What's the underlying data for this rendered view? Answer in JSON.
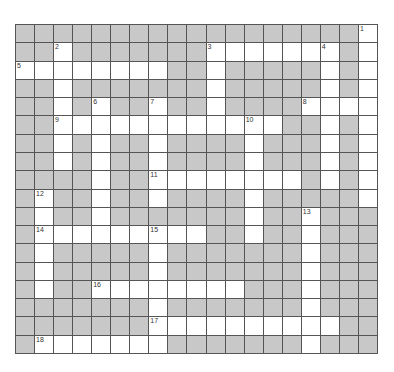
{
  "puzzle": {
    "rows": 18,
    "cols": 19,
    "colors": {
      "block": "#c8c8c8",
      "open": "#ffffff",
      "line": "#555555"
    },
    "open_cells": [
      [
        18
      ],
      [
        2,
        10,
        11,
        12,
        13,
        14,
        15,
        16,
        18
      ],
      [
        0,
        1,
        2,
        3,
        4,
        5,
        6,
        7,
        10,
        16,
        18
      ],
      [
        2,
        10,
        16,
        18
      ],
      [
        2,
        4,
        7,
        10,
        15,
        16,
        17,
        18
      ],
      [
        2,
        3,
        4,
        5,
        6,
        7,
        8,
        9,
        10,
        11,
        12,
        13,
        16,
        18
      ],
      [
        2,
        4,
        7,
        12,
        16,
        18
      ],
      [
        2,
        4,
        7,
        12,
        16,
        18
      ],
      [
        4,
        7,
        8,
        9,
        10,
        11,
        12,
        13,
        14,
        16,
        18
      ],
      [
        1,
        4,
        7,
        12,
        18
      ],
      [
        1,
        4,
        12,
        15
      ],
      [
        1,
        2,
        3,
        4,
        5,
        6,
        7,
        8,
        9,
        12,
        15
      ],
      [
        1,
        7,
        15
      ],
      [
        1,
        7,
        15
      ],
      [
        1,
        4,
        5,
        6,
        7,
        8,
        9,
        10,
        11,
        15
      ],
      [
        7,
        15
      ],
      [
        7,
        8,
        9,
        10,
        11,
        12,
        13,
        14,
        15,
        16
      ],
      [
        1,
        2,
        3,
        4,
        5,
        6,
        7,
        15
      ]
    ],
    "numbers": [
      {
        "n": "1",
        "r": 0,
        "c": 18
      },
      {
        "n": "2",
        "r": 1,
        "c": 2
      },
      {
        "n": "3",
        "r": 1,
        "c": 10
      },
      {
        "n": "4",
        "r": 1,
        "c": 16
      },
      {
        "n": "5",
        "r": 2,
        "c": 0
      },
      {
        "n": "6",
        "r": 4,
        "c": 4
      },
      {
        "n": "7",
        "r": 4,
        "c": 7
      },
      {
        "n": "8",
        "r": 4,
        "c": 15
      },
      {
        "n": "9",
        "r": 5,
        "c": 2
      },
      {
        "n": "10",
        "r": 5,
        "c": 12
      },
      {
        "n": "11",
        "r": 8,
        "c": 7
      },
      {
        "n": "12",
        "r": 9,
        "c": 1
      },
      {
        "n": "13",
        "r": 10,
        "c": 15
      },
      {
        "n": "14",
        "r": 11,
        "c": 1
      },
      {
        "n": "15",
        "r": 11,
        "c": 7
      },
      {
        "n": "16",
        "r": 14,
        "c": 4
      },
      {
        "n": "17",
        "r": 16,
        "c": 7
      },
      {
        "n": "18",
        "r": 17,
        "c": 1
      }
    ]
  }
}
